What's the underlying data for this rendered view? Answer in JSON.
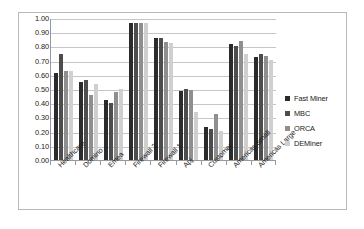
{
  "chart_data": {
    "type": "bar",
    "title": "",
    "subtitle": "",
    "xlabel": "",
    "ylabel": "",
    "ylim": [
      0.0,
      1.0
    ],
    "ytick_step": 0.1,
    "ytick_labels": [
      "1.00",
      "0.90",
      "0.80",
      "0.70",
      "0.60",
      "0.50",
      "0.40",
      "0.30",
      "0.20",
      "0.10",
      "0.00"
    ],
    "grid": true,
    "grid_axis": "y",
    "legend_position": "right",
    "categories": [
      "Healthcare",
      "Domino",
      "Emea",
      "Firewall 2",
      "Firewall 1",
      "Apj",
      "Customer",
      "Americas Small",
      "Americas Large"
    ],
    "series": [
      {
        "name": "Fast Miner",
        "color": "#2b2b2b",
        "values": [
          0.61,
          0.55,
          0.42,
          0.965,
          0.86,
          0.485,
          0.235,
          0.82,
          0.725
        ]
      },
      {
        "name": "MBC",
        "color": "#4d4d4d",
        "values": [
          0.75,
          0.565,
          0.405,
          0.965,
          0.86,
          0.5,
          0.215,
          0.805,
          0.745
        ]
      },
      {
        "name": "ORCA",
        "color": "#8f8f8f",
        "values": [
          0.63,
          0.455,
          0.48,
          0.965,
          0.83,
          0.49,
          0.325,
          0.835,
          0.73
        ]
      },
      {
        "name": "DEMiner",
        "color": "#cfcfcf",
        "values": [
          0.63,
          0.535,
          0.5,
          0.965,
          0.825,
          0.34,
          0.205,
          0.745,
          0.705
        ]
      }
    ]
  },
  "style": {
    "frame_border_color": "#b8b8b8",
    "axis_color": "#999999",
    "gridline_color": "#c6c6c6",
    "background": "#ffffff",
    "text_color": "#1a1a1a"
  }
}
